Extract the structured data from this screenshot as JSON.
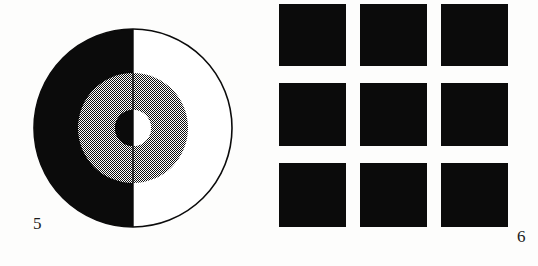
{
  "page": {
    "background_color": "#fdfdfc",
    "ink_color": "#0b0b0b",
    "width": 538,
    "height": 266
  },
  "figures": [
    {
      "number": "5",
      "label": "5",
      "name": "bisected-annulus-disc",
      "type": "circle-diagram",
      "geometry": {
        "center_x": 133,
        "center_y": 128,
        "outer_radius": 99,
        "annulus_outer_radius": 55,
        "annulus_inner_radius": 18,
        "outline_color": "#0b0b0b",
        "outline_width": 1.6
      },
      "regions": [
        {
          "name": "outer-disc-left-half",
          "fill": "#0b0b0b",
          "fill_label": "solid black"
        },
        {
          "name": "outer-disc-right-half",
          "fill": "#ffffff",
          "fill_label": "white"
        },
        {
          "name": "annulus-left-half",
          "fill": "#808080",
          "fill_label": "50% halftone checkerboard grey"
        },
        {
          "name": "annulus-right-half",
          "fill": "#808080",
          "fill_label": "50% halftone checkerboard grey"
        },
        {
          "name": "inner-disc-left-half",
          "fill": "#0b0b0b",
          "fill_label": "solid black"
        },
        {
          "name": "inner-disc-right-half",
          "fill": "#ffffff",
          "fill_label": "white"
        }
      ]
    },
    {
      "number": "6",
      "label": "6",
      "name": "three-by-three-square-grid",
      "type": "square-grid",
      "geometry": {
        "rows": 3,
        "columns": 3,
        "square_width": 67,
        "square_height": 63,
        "column_gap": 14,
        "row_gap": 17,
        "square_fill": "#0b0b0b",
        "gap_fill": "#fdfdfc"
      },
      "squares": [
        {
          "row": 1,
          "column": 1,
          "fill": "#0b0b0b"
        },
        {
          "row": 1,
          "column": 2,
          "fill": "#0b0b0b"
        },
        {
          "row": 1,
          "column": 3,
          "fill": "#0b0b0b"
        },
        {
          "row": 2,
          "column": 1,
          "fill": "#0b0b0b"
        },
        {
          "row": 2,
          "column": 2,
          "fill": "#0b0b0b"
        },
        {
          "row": 2,
          "column": 3,
          "fill": "#0b0b0b"
        },
        {
          "row": 3,
          "column": 1,
          "fill": "#0b0b0b"
        },
        {
          "row": 3,
          "column": 2,
          "fill": "#0b0b0b"
        },
        {
          "row": 3,
          "column": 3,
          "fill": "#0b0b0b"
        }
      ]
    }
  ]
}
